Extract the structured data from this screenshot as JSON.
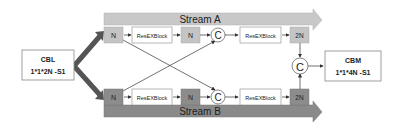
{
  "diagram": {
    "input": {
      "title": "CBL",
      "subtitle": "1*1*2N -S1"
    },
    "output": {
      "title": "CBM",
      "subtitle": "1*1*4N -S1"
    },
    "stream_a": {
      "label": "Stream A",
      "n1": "N",
      "res1": "ResEXBlock",
      "n2": "N",
      "concat": "C",
      "res2": "ResEXBlock",
      "out": "2N"
    },
    "stream_b": {
      "label": "Stream B",
      "n1": "N",
      "res1": "ResEXBlock",
      "n2": "N",
      "concat": "C",
      "res2": "ResEXBlock",
      "out": "2N"
    },
    "final_concat": "C",
    "colors": {
      "stream_a_bar": "#c8c8c8",
      "stream_b_bar": "#8a8a8a",
      "stream_a_box": "#c4c4c4",
      "stream_b_box": "#8c8c8c",
      "split_arrow": "#555555",
      "line": "#333333"
    }
  }
}
